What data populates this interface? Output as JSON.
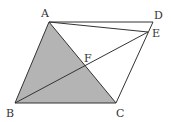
{
  "diagram": {
    "type": "geometry",
    "colors": {
      "stroke": "#333333",
      "shade": "#b4b4b4",
      "background": "#ffffff"
    },
    "points": {
      "A": {
        "label": "A",
        "x": 49,
        "y": 22
      },
      "B": {
        "label": "B",
        "x": 15,
        "y": 103
      },
      "C": {
        "label": "C",
        "x": 116,
        "y": 103
      },
      "D": {
        "label": "D",
        "x": 153,
        "y": 22
      },
      "E": {
        "label": "E",
        "x": 148,
        "y": 32
      },
      "F": {
        "label": "F",
        "x": 86,
        "y": 67
      }
    },
    "segments": [
      "AB",
      "BC",
      "CD",
      "DA",
      "AC",
      "AE",
      "BE"
    ],
    "shaded_region": [
      "A",
      "B",
      "C"
    ]
  }
}
